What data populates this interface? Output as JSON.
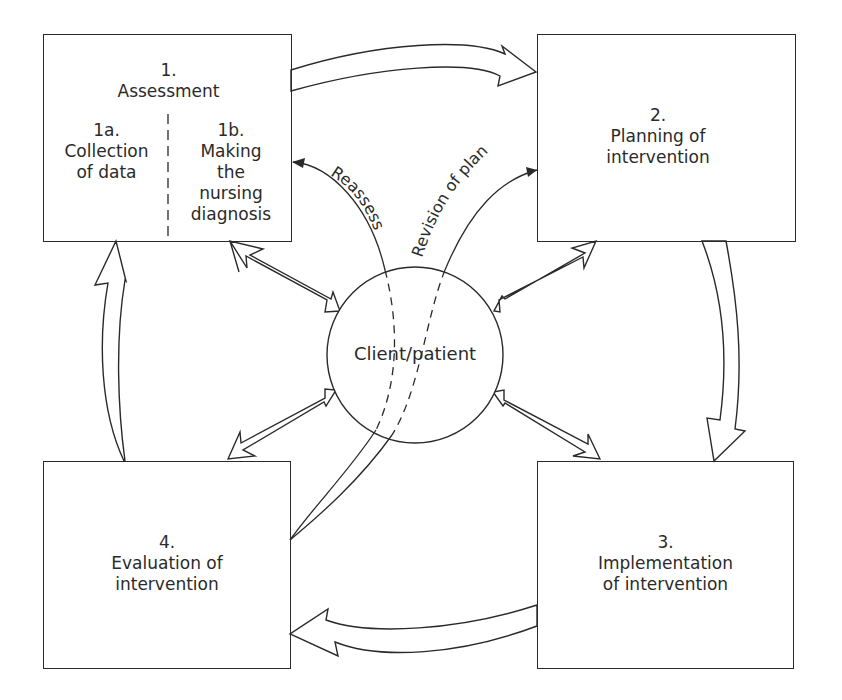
{
  "diagram": {
    "type": "nursing process cycle",
    "center": {
      "label": "Client/patient"
    },
    "steps": [
      {
        "number": "1.",
        "title": "Assessment",
        "substeps": [
          {
            "number": "1a.",
            "lines": [
              "Collection",
              "of data"
            ]
          },
          {
            "number": "1b.",
            "lines": [
              "Making",
              "the",
              "nursing",
              "diagnosis"
            ]
          }
        ]
      },
      {
        "number": "2.",
        "lines": [
          "Planning of",
          "intervention"
        ]
      },
      {
        "number": "3.",
        "lines": [
          "Implementation",
          "of intervention"
        ]
      },
      {
        "number": "4.",
        "lines": [
          "Evaluation of",
          "intervention"
        ]
      }
    ],
    "feedback_arrows": [
      {
        "label": "Reassess",
        "from": "4",
        "to": "1b"
      },
      {
        "label": "Revision of plan",
        "from": "4",
        "to": "2"
      }
    ],
    "cycle_arrows": [
      {
        "from": "1",
        "to": "2"
      },
      {
        "from": "2",
        "to": "3"
      },
      {
        "from": "3",
        "to": "4"
      },
      {
        "from": "4",
        "to": "1"
      }
    ],
    "bidirectional_arrows": [
      {
        "between": [
          "Client/patient",
          "1"
        ]
      },
      {
        "between": [
          "Client/patient",
          "2"
        ]
      },
      {
        "between": [
          "Client/patient",
          "3"
        ]
      },
      {
        "between": [
          "Client/patient",
          "4"
        ]
      }
    ],
    "colors": {
      "stroke": "#2a2a2a",
      "background": "#ffffff"
    }
  }
}
